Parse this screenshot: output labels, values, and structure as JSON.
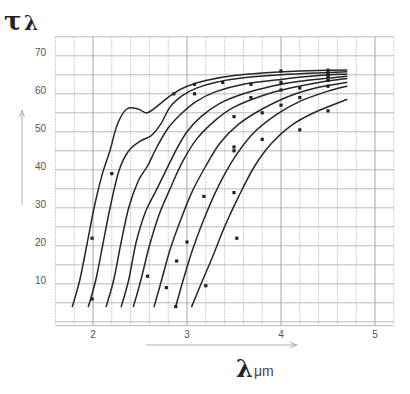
{
  "chart_data": {
    "type": "line",
    "title": "",
    "ylabel": "τλ",
    "xlabel": "λ μm",
    "xlabel_symbol": "λ",
    "xlabel_unit": "μm",
    "ylabel_symbol": "τ",
    "ylabel_subscript": "λ",
    "xlim": [
      1.6,
      5.2
    ],
    "ylim": [
      -2,
      74
    ],
    "x_ticks": [
      {
        "value": 2,
        "label": "2"
      },
      {
        "value": 3,
        "label": "3"
      },
      {
        "value": 4,
        "label": "4"
      },
      {
        "value": 5,
        "label": "5"
      }
    ],
    "y_ticks": [
      {
        "value": 10,
        "label": "10"
      },
      {
        "value": 20,
        "label": "20"
      },
      {
        "value": 30,
        "label": "30"
      },
      {
        "value": 40,
        "label": "40"
      },
      {
        "value": 50,
        "label": "50"
      },
      {
        "value": 60,
        "label": "60"
      },
      {
        "value": 70,
        "label": "70"
      }
    ],
    "grid": {
      "on": true,
      "x_step": 0.2,
      "y_step": 5
    },
    "legend": null,
    "series": [
      {
        "name": "curve-1",
        "points": [
          [
            1.78,
            3
          ],
          [
            1.86,
            10
          ],
          [
            1.94,
            20
          ],
          [
            2.02,
            30
          ],
          [
            2.1,
            38
          ],
          [
            2.18,
            44
          ],
          [
            2.26,
            51
          ],
          [
            2.36,
            55
          ],
          [
            2.48,
            55
          ],
          [
            2.58,
            54
          ],
          [
            2.72,
            56.5
          ],
          [
            2.85,
            59
          ],
          [
            3.0,
            61
          ],
          [
            3.2,
            62.5
          ],
          [
            3.5,
            63.8
          ],
          [
            3.8,
            64.5
          ],
          [
            4.2,
            65
          ],
          [
            4.5,
            65.2
          ],
          [
            4.7,
            65.3
          ]
        ],
        "markers": [
          [
            1.99,
            21
          ],
          [
            2.2,
            38
          ],
          [
            2.86,
            59
          ],
          [
            3.08,
            61.5
          ],
          [
            4.0,
            65
          ],
          [
            4.5,
            65.2
          ]
        ]
      },
      {
        "name": "curve-2",
        "points": [
          [
            1.95,
            3
          ],
          [
            2.03,
            10
          ],
          [
            2.11,
            20
          ],
          [
            2.19,
            30
          ],
          [
            2.28,
            39
          ],
          [
            2.38,
            44
          ],
          [
            2.5,
            46.5
          ],
          [
            2.62,
            48
          ],
          [
            2.72,
            51
          ],
          [
            2.82,
            55.5
          ],
          [
            2.95,
            58.5
          ],
          [
            3.1,
            60.5
          ],
          [
            3.3,
            62
          ],
          [
            3.6,
            63.2
          ],
          [
            4.0,
            64
          ],
          [
            4.4,
            64.5
          ],
          [
            4.7,
            64.8
          ]
        ],
        "markers": [
          [
            1.99,
            5
          ],
          [
            3.08,
            59
          ],
          [
            3.38,
            62
          ],
          [
            4.5,
            64.5
          ]
        ]
      },
      {
        "name": "curve-3",
        "points": [
          [
            2.14,
            3
          ],
          [
            2.22,
            10
          ],
          [
            2.3,
            20
          ],
          [
            2.38,
            29
          ],
          [
            2.48,
            36
          ],
          [
            2.58,
            40
          ],
          [
            2.68,
            45
          ],
          [
            2.8,
            50
          ],
          [
            2.95,
            54
          ],
          [
            3.1,
            57
          ],
          [
            3.3,
            59.5
          ],
          [
            3.6,
            61.5
          ],
          [
            4.0,
            62.8
          ],
          [
            4.4,
            63.8
          ],
          [
            4.7,
            64.2
          ]
        ],
        "markers": [
          [
            3.68,
            61.5
          ],
          [
            4.5,
            64
          ]
        ]
      },
      {
        "name": "curve-4",
        "points": [
          [
            2.3,
            3
          ],
          [
            2.38,
            10
          ],
          [
            2.46,
            20
          ],
          [
            2.56,
            28
          ],
          [
            2.66,
            33
          ],
          [
            2.76,
            38
          ],
          [
            2.88,
            44
          ],
          [
            3.0,
            49
          ],
          [
            3.15,
            53
          ],
          [
            3.35,
            56.5
          ],
          [
            3.6,
            59
          ],
          [
            3.9,
            61
          ],
          [
            4.2,
            62.3
          ],
          [
            4.7,
            63.6
          ]
        ],
        "markers": [
          [
            4.0,
            62
          ],
          [
            4.5,
            63.5
          ]
        ]
      },
      {
        "name": "curve-5",
        "points": [
          [
            2.43,
            3
          ],
          [
            2.51,
            10
          ],
          [
            2.6,
            19
          ],
          [
            2.7,
            27
          ],
          [
            2.82,
            34
          ],
          [
            2.95,
            41
          ],
          [
            3.1,
            47
          ],
          [
            3.3,
            52
          ],
          [
            3.5,
            55.5
          ],
          [
            3.8,
            58.5
          ],
          [
            4.1,
            60.5
          ],
          [
            4.4,
            62
          ],
          [
            4.7,
            63
          ]
        ],
        "markers": [
          [
            2.58,
            11
          ],
          [
            3.68,
            58
          ],
          [
            4.2,
            60.5
          ],
          [
            4.5,
            62.5
          ]
        ]
      },
      {
        "name": "curve-6",
        "points": [
          [
            2.65,
            3
          ],
          [
            2.73,
            10
          ],
          [
            2.82,
            18
          ],
          [
            2.92,
            25
          ],
          [
            3.05,
            33
          ],
          [
            3.2,
            40
          ],
          [
            3.35,
            46
          ],
          [
            3.55,
            51
          ],
          [
            3.8,
            55
          ],
          [
            4.1,
            58.5
          ],
          [
            4.4,
            60.7
          ],
          [
            4.7,
            62
          ]
        ],
        "markers": [
          [
            2.78,
            8
          ],
          [
            2.89,
            15
          ],
          [
            3.0,
            20
          ],
          [
            3.5,
            53
          ],
          [
            4.0,
            60
          ],
          [
            4.2,
            58
          ]
        ]
      },
      {
        "name": "curve-7",
        "points": [
          [
            2.88,
            3
          ],
          [
            2.96,
            10
          ],
          [
            3.06,
            18
          ],
          [
            3.18,
            26
          ],
          [
            3.32,
            34
          ],
          [
            3.5,
            42
          ],
          [
            3.7,
            48.5
          ],
          [
            3.95,
            53.5
          ],
          [
            4.2,
            57
          ],
          [
            4.5,
            59.7
          ],
          [
            4.7,
            61
          ]
        ],
        "markers": [
          [
            2.88,
            3
          ],
          [
            3.18,
            32
          ],
          [
            3.5,
            45
          ],
          [
            3.5,
            44
          ],
          [
            3.8,
            54
          ],
          [
            4.0,
            56
          ],
          [
            4.5,
            61
          ]
        ]
      },
      {
        "name": "curve-8",
        "points": [
          [
            3.05,
            3
          ],
          [
            3.15,
            9
          ],
          [
            3.27,
            16
          ],
          [
            3.4,
            24
          ],
          [
            3.55,
            32
          ],
          [
            3.72,
            40
          ],
          [
            3.9,
            46
          ],
          [
            4.1,
            50.5
          ],
          [
            4.35,
            54
          ],
          [
            4.7,
            57.5
          ]
        ],
        "markers": [
          [
            3.2,
            8.5
          ],
          [
            3.5,
            33
          ],
          [
            3.53,
            21
          ],
          [
            3.8,
            47
          ],
          [
            4.2,
            49.5
          ],
          [
            4.5,
            54.5
          ]
        ]
      }
    ]
  },
  "axes": {
    "y_symbol": "τ",
    "y_sub": "λ",
    "x_symbol": "λ",
    "x_unit": "μm"
  }
}
